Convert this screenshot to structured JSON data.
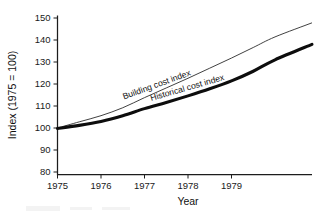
{
  "chart_data": {
    "type": "line",
    "title": "",
    "xlabel": "Year",
    "ylabel": "Index (1975 = 100)",
    "xlim": [
      1975,
      1980.85
    ],
    "ylim": [
      80,
      152
    ],
    "grid": false,
    "legend_position": "inline-on-curve",
    "x_ticks": [
      "1975",
      "1976",
      "1977",
      "1978",
      "1979"
    ],
    "x_tick_values": [
      1975,
      1976,
      1977,
      1978,
      1979
    ],
    "y_ticks": [
      "80",
      "90",
      "100",
      "110",
      "120",
      "130",
      "140",
      "150"
    ],
    "y_tick_values": [
      80,
      90,
      100,
      110,
      120,
      130,
      140,
      150
    ],
    "x": [
      1975,
      1975.5,
      1976,
      1976.5,
      1977,
      1977.5,
      1978,
      1978.5,
      1979,
      1979.5,
      1980,
      1980.85
    ],
    "series": [
      {
        "name": "Building cost index",
        "style": "thin",
        "values": [
          100,
          102.8,
          105.6,
          109.2,
          113.8,
          118.2,
          122.6,
          127.2,
          131.8,
          136.6,
          141.4,
          147.8
        ]
      },
      {
        "name": "Historical cost index",
        "style": "thick",
        "values": [
          99.8,
          101.2,
          103.0,
          105.6,
          108.8,
          111.6,
          114.6,
          117.8,
          121.4,
          125.8,
          131.0,
          138.0
        ]
      }
    ],
    "annotations": [
      {
        "text": "Building cost index",
        "at_x": 1977.3,
        "rotation": -20
      },
      {
        "text": "Historical cost index",
        "at_x": 1978.0,
        "rotation": -16
      }
    ]
  }
}
